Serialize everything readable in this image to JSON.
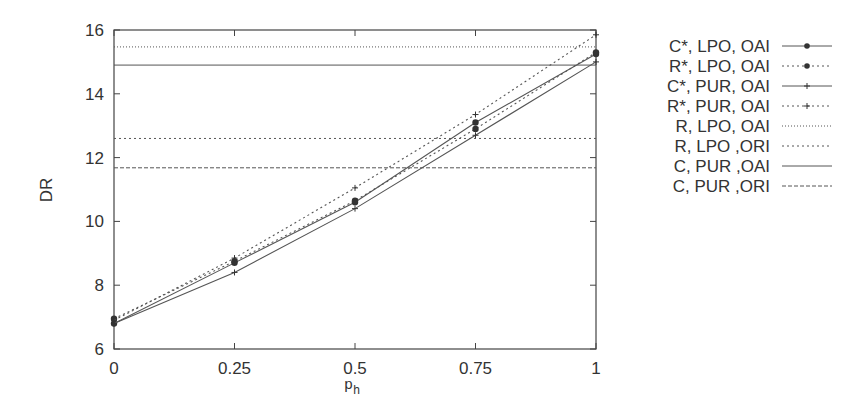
{
  "chart_data": {
    "type": "line",
    "title": "",
    "xlabel": "p_h",
    "xlabel_main": "p",
    "xlabel_sub": "h",
    "ylabel": "DR",
    "xlim": [
      0,
      1
    ],
    "ylim": [
      6,
      16
    ],
    "grid": false,
    "legend_position": "right-outside",
    "x": [
      0,
      0.25,
      0.5,
      0.75,
      1
    ],
    "x_tick_labels": [
      "0",
      "0.25",
      "0.5",
      "0.75",
      "1"
    ],
    "y_ticks": [
      6,
      8,
      10,
      12,
      14,
      16
    ],
    "y_tick_labels": [
      "6",
      "8",
      "10",
      "12",
      "14",
      "16"
    ],
    "series": [
      {
        "name": "C*, LPO, OAI",
        "style": "solid",
        "marker": "dot",
        "values": [
          6.8,
          8.7,
          10.6,
          13.1,
          15.25
        ]
      },
      {
        "name": "R*, LPO, OAI",
        "style": "dotted",
        "marker": "dot",
        "values": [
          6.95,
          8.75,
          10.65,
          12.9,
          15.3
        ]
      },
      {
        "name": "C*, PUR, OAI",
        "style": "solid",
        "marker": "plus",
        "values": [
          6.8,
          8.4,
          10.4,
          12.7,
          15.0
        ]
      },
      {
        "name": "R*, PUR, OAI",
        "style": "dotted",
        "marker": "plus",
        "values": [
          6.9,
          8.85,
          11.05,
          13.35,
          15.85
        ]
      },
      {
        "name": "R, LPO, OAI",
        "style": "dash-dot",
        "marker": "none",
        "constant": 15.47
      },
      {
        "name": "R, LPO ,ORI",
        "style": "dotted",
        "marker": "none",
        "constant": 12.6
      },
      {
        "name": "C, PUR ,OAI",
        "style": "solid",
        "marker": "none",
        "constant": 14.9
      },
      {
        "name": "C, PUR ,ORI",
        "style": "dashed",
        "marker": "none",
        "constant": 11.68
      }
    ]
  }
}
